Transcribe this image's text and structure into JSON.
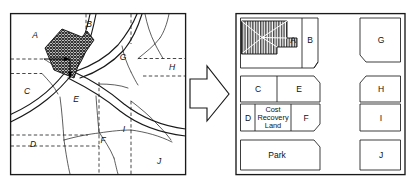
{
  "figure": {
    "panels": [
      {
        "id": "before",
        "name": "original-cadastral-map",
        "caption": "",
        "parcel_labels": [
          "A",
          "B",
          "C",
          "D",
          "E",
          "F",
          "G",
          "H",
          "I",
          "J"
        ],
        "features": {
          "building": "hatched-building-footprint",
          "roads": "curving-road-network",
          "boundaries": "dashed-parcel-boundaries"
        }
      },
      {
        "id": "after",
        "name": "readjusted-block-plan",
        "caption": "",
        "parcel_labels": [
          "A",
          "B",
          "C",
          "D",
          "E",
          "F",
          "G",
          "H",
          "I",
          "J"
        ],
        "special_labels": [
          "Cost Recovery Land",
          "Park"
        ],
        "features": {
          "building": "hatched-building-footprint",
          "roads": "orthogonal-street-grid"
        }
      }
    ],
    "connector": {
      "name": "transformation-arrow",
      "direction": "right",
      "label": ""
    },
    "labels": {
      "before": {
        "A": "A",
        "B": "B",
        "C": "C",
        "D": "D",
        "E": "E",
        "F": "F",
        "G": "G",
        "H": "H",
        "I": "I",
        "J": "J"
      },
      "after": {
        "A": "A",
        "B": "B",
        "C": "C",
        "D": "D",
        "E": "E",
        "F": "F",
        "G": "G",
        "H": "H",
        "I": "I",
        "J": "J",
        "cost_recovery_line1": "Cost",
        "cost_recovery_line2": "Recovery",
        "cost_recovery_line3": "Land",
        "park": "Park"
      }
    },
    "colors": {
      "ink": "#1a1a1a",
      "paper": "#ffffff",
      "hatch": "#3a3a3a"
    }
  }
}
